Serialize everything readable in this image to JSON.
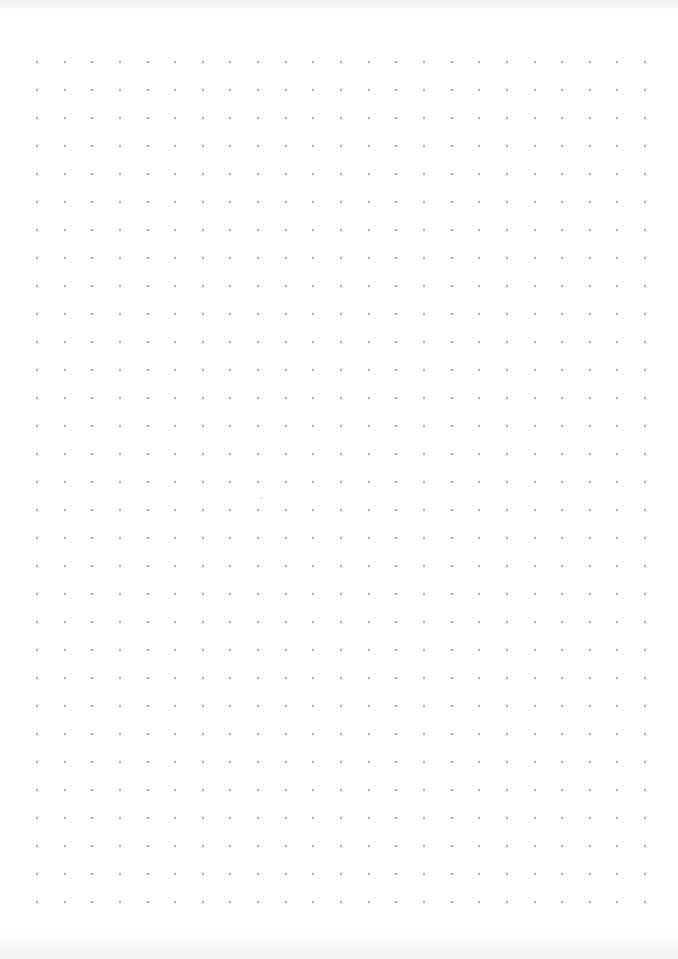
{
  "page": {
    "type": "dot-grid-paper",
    "background_color": "#ffffff"
  },
  "grid": {
    "dot_color": "#8a8a8a",
    "dot_size_px": 2,
    "columns": 23,
    "rows": 31,
    "origin_x": 37,
    "origin_y": 62,
    "spacing_x": 27.64,
    "spacing_y": 28
  }
}
